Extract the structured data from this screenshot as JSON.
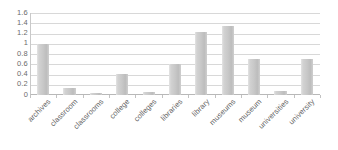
{
  "chart_data": {
    "type": "bar",
    "title": "",
    "subtitle": "",
    "xlabel": "",
    "ylabel": "",
    "ylim": [
      0,
      1.6
    ],
    "grid": true,
    "legend": false,
    "legend_position": "none",
    "bar_color": "#c8c8c8",
    "gridline_color": "#d8d8d8",
    "axis_color": "#b8b8b8",
    "text_color": "#5f5f5f",
    "ytick_labels": [
      "1.6",
      "1.4",
      "1.2",
      "1",
      "0.8",
      "0.6",
      "0.4",
      "0.2",
      "0"
    ],
    "ytick_values": [
      1.6,
      1.4,
      1.2,
      1.0,
      0.8,
      0.6,
      0.4,
      0.2,
      0
    ],
    "categories": [
      "archives",
      "classroom",
      "classrooms",
      "college",
      "colleges",
      "libraries",
      "library",
      "museums",
      "museum",
      "universities",
      "university"
    ],
    "values": [
      1.0,
      0.14,
      0.04,
      0.41,
      0.05,
      0.6,
      1.22,
      1.35,
      0.7,
      0.08,
      0.71
    ]
  }
}
